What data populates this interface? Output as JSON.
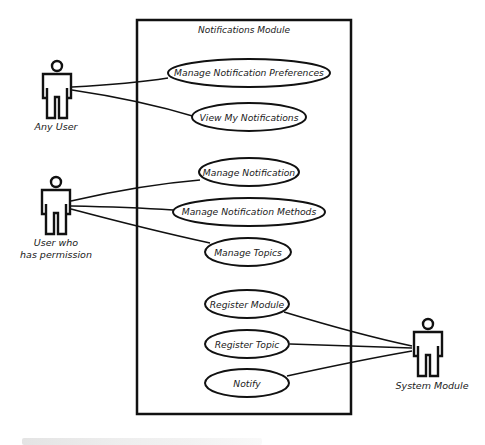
{
  "diagram": {
    "type": "uml-use-case",
    "system_boundary": {
      "title": "Notifications Module"
    },
    "actors": [
      {
        "id": "any-user",
        "label_lines": [
          "Any User"
        ]
      },
      {
        "id": "user-with-permission",
        "label_lines": [
          "User who",
          "has permission"
        ]
      },
      {
        "id": "system-module",
        "label_lines": [
          "System Module"
        ]
      }
    ],
    "use_cases": [
      {
        "id": "uc1",
        "label": "Manage Notification Preferences"
      },
      {
        "id": "uc2",
        "label": "View My Notifications"
      },
      {
        "id": "uc3",
        "label": "Manage Notification"
      },
      {
        "id": "uc4",
        "label": "Manage Notification Methods"
      },
      {
        "id": "uc5",
        "label": "Manage Topics"
      },
      {
        "id": "uc6",
        "label": "Register Module"
      },
      {
        "id": "uc7",
        "label": "Register Topic"
      },
      {
        "id": "uc8",
        "label": "Notify"
      }
    ],
    "associations": [
      [
        "any-user",
        "uc1"
      ],
      [
        "any-user",
        "uc2"
      ],
      [
        "user-with-permission",
        "uc3"
      ],
      [
        "user-with-permission",
        "uc4"
      ],
      [
        "user-with-permission",
        "uc5"
      ],
      [
        "system-module",
        "uc6"
      ],
      [
        "system-module",
        "uc7"
      ],
      [
        "system-module",
        "uc8"
      ]
    ]
  },
  "colors": {
    "stroke": "#111111",
    "background": "#ffffff"
  }
}
